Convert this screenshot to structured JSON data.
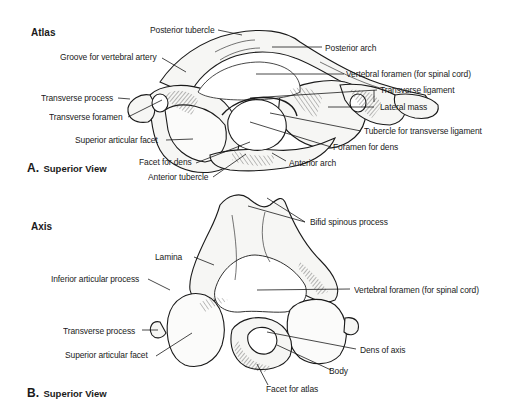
{
  "figure": {
    "panel_a": {
      "title": "Atlas",
      "view_letter": "A.",
      "view_text": "Superior View",
      "labels": {
        "posterior_tubercle": "Posterior tubercle",
        "groove_vertebral_artery": "Groove for vertebral artery",
        "transverse_process": "Transverse process",
        "transverse_foramen": "Transverse foramen",
        "superior_articular_facet": "Superior articular facet",
        "facet_for_dens": "Facet for dens",
        "anterior_tubercle": "Anterior tubercle",
        "posterior_arch": "Posterior arch",
        "vertebral_foramen": "Vertebral foramen (for spinal cord)",
        "transverse_ligament": "Transverse ligament",
        "lateral_mass": "Lateral mass",
        "tubercle_transverse_ligament": "Tubercle for transverse ligament",
        "foramen_for_dens": "Foramen for dens",
        "anterior_arch": "Anterior arch"
      }
    },
    "panel_b": {
      "title": "Axis",
      "view_letter": "B.",
      "view_text": "Superior View",
      "labels": {
        "bifid_spinous_process": "Bifid spinous process",
        "lamina": "Lamina",
        "inferior_articular_process": "Inferior articular process",
        "vertebral_foramen": "Vertebral foramen (for spinal cord)",
        "transverse_process": "Transverse process",
        "superior_articular_facet": "Superior articular facet",
        "dens_of_axis": "Dens of axis",
        "body": "Body",
        "facet_for_atlas": "Facet for atlas"
      }
    }
  }
}
